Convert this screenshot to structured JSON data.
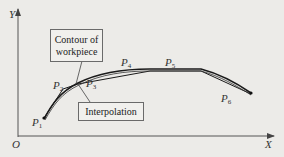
{
  "diagram": {
    "axes": {
      "x_label": "X",
      "y_label": "Y",
      "origin_label": "O"
    },
    "callouts": {
      "contour": {
        "line1": "Contour of",
        "line2": "workpiece"
      },
      "interpolation": {
        "label": "Interpolation"
      }
    },
    "points": [
      {
        "name": "P",
        "sub": "1"
      },
      {
        "name": "P",
        "sub": "2"
      },
      {
        "name": "P",
        "sub": "3"
      },
      {
        "name": "P",
        "sub": "4"
      },
      {
        "name": "P",
        "sub": "5"
      },
      {
        "name": "P",
        "sub": "6"
      }
    ],
    "colors": {
      "curve": "#1a1a1a",
      "axis": "#444444",
      "background": "#ecebe8"
    }
  }
}
